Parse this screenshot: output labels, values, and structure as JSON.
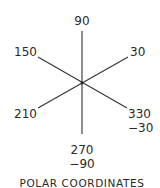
{
  "diagram": {
    "title": "POLAR COORDINATES",
    "center": {
      "x": 82,
      "y": 83
    },
    "line_color": "#333333",
    "text_color": "#2a2a2a",
    "axes": [
      {
        "angle": 90,
        "label": "90",
        "sub": ""
      },
      {
        "angle": 30,
        "label": "30",
        "sub": ""
      },
      {
        "angle": 150,
        "label": "150",
        "sub": ""
      },
      {
        "angle": 210,
        "label": "210",
        "sub": ""
      },
      {
        "angle": 270,
        "label": "270",
        "sub": "−90"
      },
      {
        "angle": 330,
        "label": "330",
        "sub": "−30"
      }
    ]
  }
}
